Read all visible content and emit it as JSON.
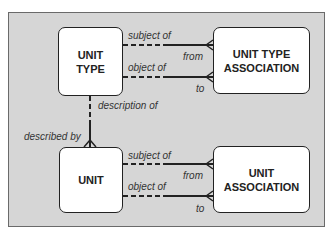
{
  "caption": "",
  "entities": {
    "unit_type": {
      "line1": "UNIT",
      "line2": "TYPE"
    },
    "unit_type_association": {
      "line1": "UNIT TYPE",
      "line2": "ASSOCIATION"
    },
    "unit": {
      "line1": "UNIT",
      "line2": ""
    },
    "unit_association": {
      "line1": "UNIT",
      "line2": "ASSOCIATION"
    }
  },
  "relationships": {
    "top_subject_of": "subject of",
    "top_from": "from",
    "top_object_of": "object of",
    "top_to": "to",
    "description_of": "description of",
    "described_by": "described by",
    "bottom_subject_of": "subject of",
    "bottom_from": "from",
    "bottom_object_of": "object of",
    "bottom_to": "to"
  },
  "colors": {
    "frame_background": "#d6d6d6",
    "entity_fill": "#ffffff",
    "line": "#222222"
  }
}
